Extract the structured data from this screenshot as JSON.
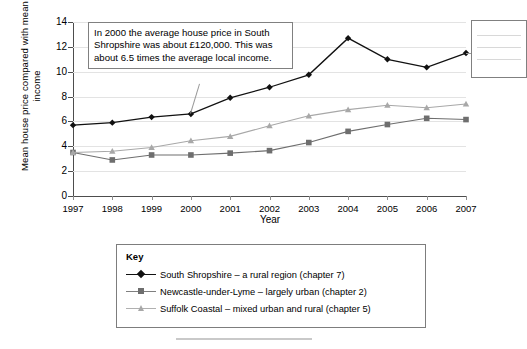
{
  "chart_data": {
    "type": "line",
    "title": "",
    "xlabel": "Year",
    "ylabel": "Mean house price compared with mean income",
    "categories": [
      "1997",
      "1998",
      "1999",
      "2000",
      "2001",
      "2002",
      "2003",
      "2004",
      "2005",
      "2006",
      "2007"
    ],
    "x": [
      1997,
      1998,
      1999,
      2000,
      2001,
      2002,
      2003,
      2004,
      2005,
      2006,
      2007
    ],
    "ylim": [
      0,
      14
    ],
    "xlim": [
      1997,
      2007
    ],
    "yticks": [
      0,
      2,
      4,
      6,
      8,
      10,
      12,
      14
    ],
    "grid": true,
    "legend_position": "below-chart",
    "series": [
      {
        "name": "South Shropshire – a rural region (chapter 7)",
        "short_name": "South Shropshire",
        "marker": "diamond",
        "color": "#111111",
        "values": [
          5.7,
          5.9,
          6.35,
          6.6,
          7.9,
          8.75,
          9.75,
          12.7,
          11.0,
          10.35,
          11.5
        ]
      },
      {
        "name": "Newcastle-under-Lyme – largely urban (chapter 2)",
        "short_name": "Newcastle-under-Lyme",
        "marker": "square",
        "color": "#6e6e6e",
        "values": [
          3.5,
          2.9,
          3.3,
          3.3,
          3.45,
          3.65,
          4.3,
          5.2,
          5.75,
          6.25,
          6.15
        ]
      },
      {
        "name": "Suffolk Coastal – mixed urban and rural (chapter 5)",
        "short_name": "Suffolk Coastal",
        "marker": "triangle",
        "color": "#a8a8a8",
        "values": [
          3.5,
          3.6,
          3.9,
          4.45,
          4.8,
          5.65,
          6.45,
          6.95,
          7.3,
          7.1,
          7.4
        ]
      }
    ],
    "annotations": [
      {
        "id": "callout-2000",
        "text": "In 2000 the average house price in South Shropshire was about £120,000. This was about 6.5 times the average local income.",
        "points_to": {
          "series": "South Shropshire",
          "x": 2000,
          "y": 6.6
        }
      },
      {
        "id": "callout-right-clipped",
        "text": "",
        "points_to": {
          "series": "South Shropshire",
          "x": 2007,
          "y": 11.5
        }
      }
    ]
  },
  "axes": {
    "y_label": "Mean house price compared with mean income",
    "x_label": "Year",
    "y_ticks": [
      "0",
      "2",
      "4",
      "6",
      "8",
      "10",
      "12",
      "14"
    ],
    "x_ticks": [
      "1997",
      "1998",
      "1999",
      "2000",
      "2001",
      "2002",
      "2003",
      "2004",
      "2005",
      "2006",
      "2007"
    ]
  },
  "annotation": {
    "main_text": "In 2000 the average house price in South Shropshire was about £120,000. This was about 6.5 times the average local income."
  },
  "legend": {
    "title": "Key",
    "items": [
      {
        "label": "South Shropshire – a rural region (chapter 7)"
      },
      {
        "label": "Newcastle-under-Lyme – largely urban (chapter 2)"
      },
      {
        "label": "Suffolk Coastal – mixed urban and rural (chapter 5)"
      }
    ]
  }
}
